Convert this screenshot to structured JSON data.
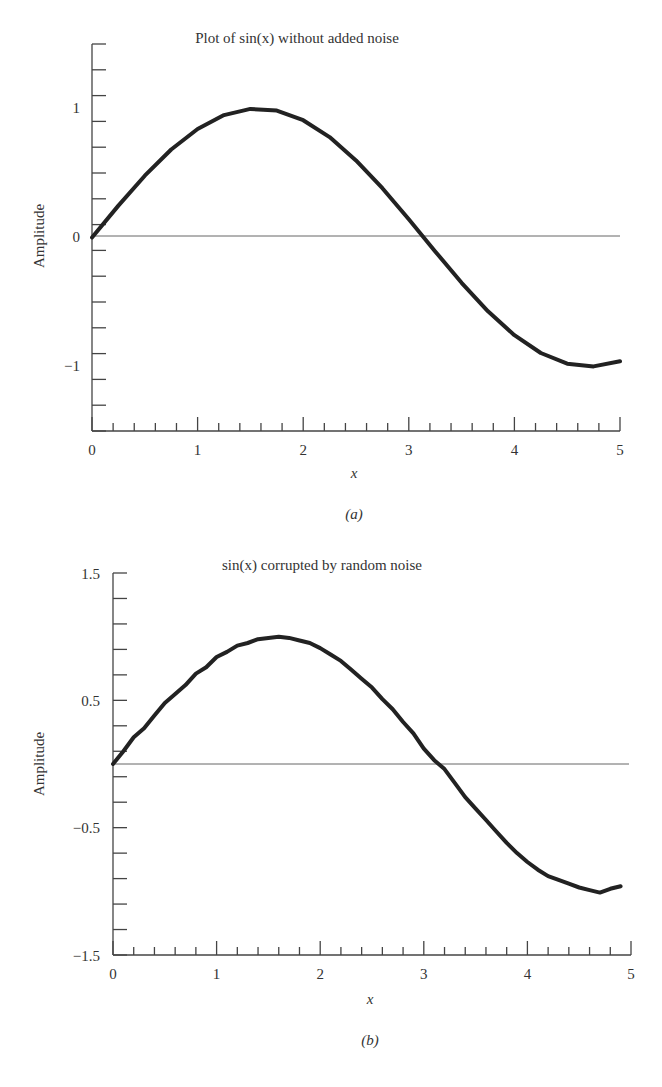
{
  "figure_a": {
    "title": "Plot of sin(x) without added noise",
    "ylabel": "Amplitude",
    "xlabel": "x",
    "caption": "(a)",
    "xticks": [
      "0",
      "1",
      "2",
      "3",
      "4",
      "5"
    ],
    "yticks": [
      "1",
      "0",
      "−1"
    ]
  },
  "figure_b": {
    "title": "sin(x) corrupted by random noise",
    "ylabel": "Amplitude",
    "xlabel": "x",
    "caption": "(b)",
    "xticks": [
      "0",
      "1",
      "2",
      "3",
      "4",
      "5"
    ],
    "yticks": [
      "1.5",
      "0.5",
      "−0.5",
      "−1.5"
    ]
  },
  "colors": {
    "curve": "#222222",
    "axis": "#444444",
    "text": "#333333"
  },
  "chart_data": [
    {
      "type": "line",
      "title": "Plot of sin(x) without added noise",
      "xlabel": "x",
      "ylabel": "Amplitude",
      "xlim": [
        0,
        5
      ],
      "ylim": [
        -1.5,
        1.5
      ],
      "xticks": [
        0,
        1,
        2,
        3,
        4,
        5
      ],
      "yticks_labeled": [
        -1,
        0,
        1
      ],
      "minor_ytick_step": 0.2,
      "minor_xtick_step": 0.2,
      "reference_line": {
        "y": 0
      },
      "series": [
        {
          "name": "sin(x)",
          "x": [
            0,
            0.25,
            0.5,
            0.75,
            1,
            1.25,
            1.5,
            1.75,
            2,
            2.25,
            2.5,
            2.75,
            3,
            3.25,
            3.5,
            3.75,
            4,
            4.25,
            4.5,
            4.75,
            5
          ],
          "values": [
            0,
            0.247,
            0.479,
            0.682,
            0.841,
            0.949,
            0.997,
            0.984,
            0.909,
            0.778,
            0.598,
            0.382,
            0.141,
            -0.108,
            -0.351,
            -0.572,
            -0.757,
            -0.895,
            -0.978,
            -0.999,
            -0.959
          ]
        }
      ],
      "caption": "(a)"
    },
    {
      "type": "line",
      "title": "sin(x) corrupted by random noise",
      "xlabel": "x",
      "ylabel": "Amplitude",
      "xlim": [
        0,
        5
      ],
      "ylim": [
        -1.5,
        1.5
      ],
      "xticks": [
        0,
        1,
        2,
        3,
        4,
        5
      ],
      "yticks_labeled": [
        -1.5,
        -0.5,
        0.5,
        1.5
      ],
      "minor_ytick_step": 0.2,
      "minor_xtick_step": 0.2,
      "reference_line": {
        "y": 0
      },
      "series": [
        {
          "name": "sin(x) + noise",
          "x": [
            0,
            0.1,
            0.2,
            0.3,
            0.4,
            0.5,
            0.6,
            0.7,
            0.8,
            0.9,
            1.0,
            1.1,
            1.2,
            1.3,
            1.4,
            1.5,
            1.6,
            1.7,
            1.8,
            1.9,
            2.0,
            2.1,
            2.2,
            2.3,
            2.4,
            2.5,
            2.6,
            2.7,
            2.8,
            2.9,
            3.0,
            3.1,
            3.2,
            3.3,
            3.4,
            3.5,
            3.6,
            3.7,
            3.8,
            3.9,
            4.0,
            4.1,
            4.2,
            4.3,
            4.4,
            4.5,
            4.6,
            4.7,
            4.8,
            4.9
          ],
          "values": [
            0.0,
            0.1,
            0.21,
            0.28,
            0.38,
            0.48,
            0.55,
            0.62,
            0.71,
            0.76,
            0.84,
            0.88,
            0.93,
            0.95,
            0.98,
            0.99,
            1.0,
            0.99,
            0.97,
            0.95,
            0.91,
            0.86,
            0.81,
            0.74,
            0.67,
            0.6,
            0.51,
            0.43,
            0.33,
            0.24,
            0.12,
            0.03,
            -0.04,
            -0.15,
            -0.26,
            -0.35,
            -0.44,
            -0.53,
            -0.62,
            -0.7,
            -0.77,
            -0.83,
            -0.88,
            -0.91,
            -0.94,
            -0.97,
            -0.99,
            -1.01,
            -0.98,
            -0.96
          ]
        }
      ],
      "caption": "(b)"
    }
  ]
}
